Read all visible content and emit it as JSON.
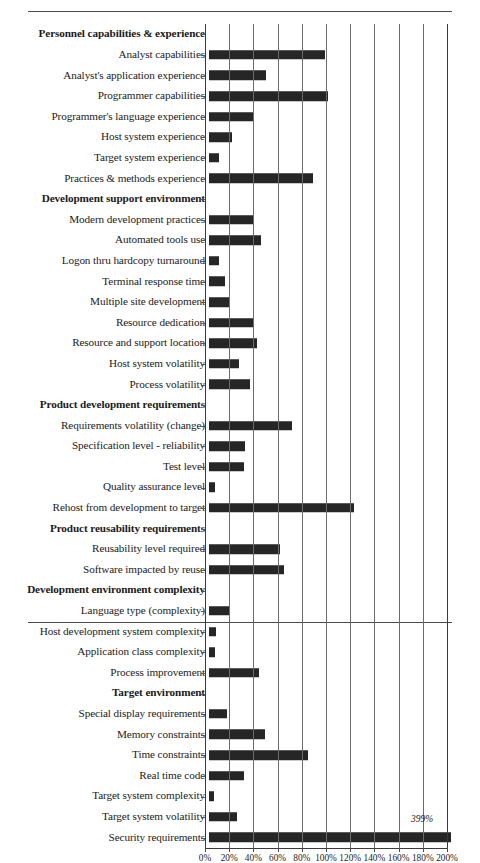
{
  "chart_data": {
    "type": "bar",
    "orientation": "horizontal",
    "title": "",
    "xlabel": "",
    "ylabel": "",
    "xlim": [
      0,
      200
    ],
    "xticks": [
      "0%",
      "20%",
      "40%",
      "60%",
      "80%",
      "100%",
      "120%",
      "140%",
      "160%",
      "180%",
      "200%"
    ],
    "xtick_values": [
      0,
      20,
      40,
      60,
      80,
      100,
      120,
      140,
      160,
      180,
      200
    ],
    "grid": true,
    "legend": null,
    "bar_color": "#262626",
    "grid_color": "#6b6b6b",
    "annotations": [
      {
        "text": "399%",
        "category": "Security requirements",
        "value": 399
      }
    ],
    "rows": [
      {
        "label": "Personnel capabilities & experience",
        "group": true,
        "value": null
      },
      {
        "label": "Analyst capabilities",
        "group": false,
        "value": 96
      },
      {
        "label": "Analyst's application experience",
        "group": false,
        "value": 47
      },
      {
        "label": "Programmer capabilities",
        "group": false,
        "value": 98
      },
      {
        "label": "Programmer's language experience",
        "group": false,
        "value": 36
      },
      {
        "label": "Host system experience",
        "group": false,
        "value": 19
      },
      {
        "label": "Target system experience",
        "group": false,
        "value": 8
      },
      {
        "label": "Practices & methods experience",
        "group": false,
        "value": 86
      },
      {
        "label": "Development support environment",
        "group": true,
        "value": null
      },
      {
        "label": "Modern development practices",
        "group": false,
        "value": 37
      },
      {
        "label": "Automated tools use",
        "group": false,
        "value": 43
      },
      {
        "label": "Logon thru hardcopy turnaround",
        "group": false,
        "value": 8
      },
      {
        "label": "Terminal response time",
        "group": false,
        "value": 13
      },
      {
        "label": "Multiple site development",
        "group": false,
        "value": 17
      },
      {
        "label": "Resource dedication",
        "group": false,
        "value": 37
      },
      {
        "label": "Resource and support location",
        "group": false,
        "value": 40
      },
      {
        "label": "Host system volatility",
        "group": false,
        "value": 25
      },
      {
        "label": "Process volatility",
        "group": false,
        "value": 34
      },
      {
        "label": "Product development requirements",
        "group": true,
        "value": null
      },
      {
        "label": "Requirements volatility (change)",
        "group": false,
        "value": 69
      },
      {
        "label": "Specification level - reliability",
        "group": false,
        "value": 30
      },
      {
        "label": "Test level",
        "group": false,
        "value": 29
      },
      {
        "label": "Quality assurance level",
        "group": false,
        "value": 5
      },
      {
        "label": "Rehost from development to target",
        "group": false,
        "value": 120
      },
      {
        "label": "Product reusability requirements",
        "group": true,
        "value": null
      },
      {
        "label": "Reusability level required",
        "group": false,
        "value": 59
      },
      {
        "label": "Software impacted by reuse",
        "group": false,
        "value": 62
      },
      {
        "label": "Development environment complexity",
        "group": true,
        "value": null
      },
      {
        "label": "Language type (complexity)",
        "group": false,
        "value": 17
      },
      {
        "label": "Host development system complexity",
        "group": false,
        "value": 6
      },
      {
        "label": "Application class complexity",
        "group": false,
        "value": 5
      },
      {
        "label": "Process improvement",
        "group": false,
        "value": 41
      },
      {
        "label": "Target environment",
        "group": true,
        "value": null
      },
      {
        "label": "Special display requirements",
        "group": false,
        "value": 15
      },
      {
        "label": "Memory constraints",
        "group": false,
        "value": 46
      },
      {
        "label": "Time constraints",
        "group": false,
        "value": 82
      },
      {
        "label": "Real time code",
        "group": false,
        "value": 29
      },
      {
        "label": "Target system complexity",
        "group": false,
        "value": 4
      },
      {
        "label": "Target system volatility",
        "group": false,
        "value": 23
      },
      {
        "label": "Security requirements",
        "group": false,
        "value": 399
      }
    ]
  }
}
